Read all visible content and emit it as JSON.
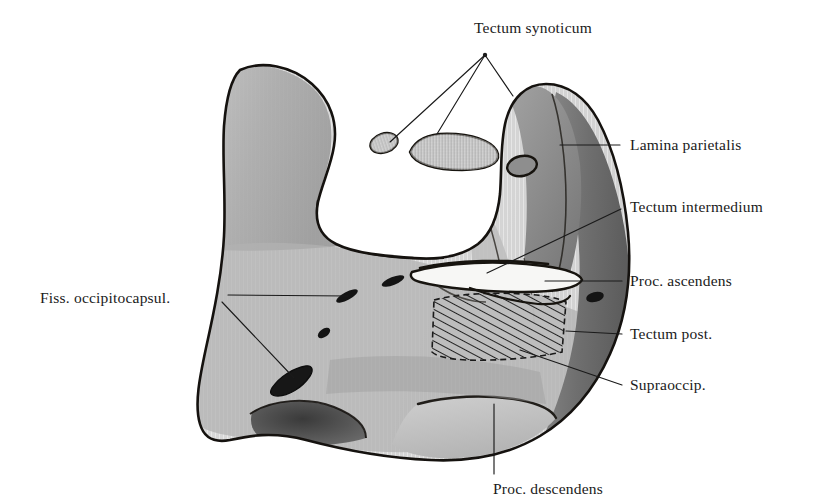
{
  "figure": {
    "kind": "anatomical-illustration",
    "background_color": "#ffffff",
    "ink_color": "#1a1a1a",
    "tones": {
      "light_gray": "#c9c9c9",
      "mid_gray": "#a8a8a8",
      "dark_gray": "#7b7b7b",
      "deep_gray": "#5a5a5a",
      "shadow": "#3b3b3b",
      "outline": "#15120f"
    }
  },
  "labels": [
    {
      "id": "tectum-synoticum",
      "text": "Tectum synoticum",
      "x": 474,
      "y": 20,
      "align": "left",
      "leader_from": [
        485,
        55
      ],
      "leader_to": [
        [
          390,
          142
        ],
        [
          437,
          134
        ],
        [
          512,
          95
        ]
      ]
    },
    {
      "id": "lamina-parietalis",
      "text": "Lamina parietalis",
      "x": 630,
      "y": 137,
      "align": "left",
      "leader_from": [
        620,
        145
      ],
      "leader_to": [
        [
          560,
          145
        ]
      ]
    },
    {
      "id": "tectum-intermedium",
      "text": "Tectum intermedium",
      "x": 630,
      "y": 199,
      "align": "left",
      "leader_from": [
        621,
        209
      ],
      "leader_to": [
        [
          487,
          273
        ]
      ]
    },
    {
      "id": "proc-ascendens",
      "text": "Proc. ascendens",
      "x": 630,
      "y": 273,
      "align": "left",
      "leader_from": [
        622,
        281
      ],
      "leader_to": [
        [
          545,
          281
        ]
      ]
    },
    {
      "id": "tectum-post",
      "text": "Tectum post.",
      "x": 630,
      "y": 326,
      "align": "left",
      "leader_from": [
        622,
        334
      ],
      "leader_to": [
        [
          568,
          331
        ]
      ]
    },
    {
      "id": "supraoccip",
      "text": "Supraoccip.",
      "x": 630,
      "y": 377,
      "align": "left",
      "leader_from": [
        622,
        385
      ],
      "leader_to": [
        [
          520,
          350
        ]
      ]
    },
    {
      "id": "fiss-occipitocapsul",
      "text": "Fiss. occipitocapsul.",
      "x": 40,
      "y": 290,
      "align": "left",
      "leader_from": [
        228,
        297
      ],
      "leader_to": [
        [
          348,
          296
        ],
        [
          292,
          379
        ]
      ]
    },
    {
      "id": "proc-descendens",
      "text": "Proc. descendens",
      "x": 493,
      "y": 481,
      "align": "left",
      "leader_from": [
        494,
        474
      ],
      "leader_to": [
        [
          494,
          405
        ]
      ]
    }
  ],
  "structures": {
    "main_mass": "large bilobed cartilage plate occupying the centre of the plate",
    "detached_fragments": [
      {
        "id": "fragment-small-oval",
        "center": [
          384,
          143
        ],
        "rx": 13,
        "ry": 9
      },
      {
        "id": "fragment-elongate",
        "center": [
          452,
          150
        ],
        "rx": 44,
        "ry": 15
      },
      {
        "id": "fragment-dark-oval",
        "center": [
          522,
          165
        ],
        "rx": 14,
        "ry": 10
      }
    ],
    "foramina": [
      {
        "id": "foramen-a",
        "center": [
          346,
          296
        ]
      },
      {
        "id": "foramen-b",
        "center": [
          392,
          281
        ]
      },
      {
        "id": "foramen-c",
        "center": [
          324,
          333
        ]
      },
      {
        "id": "foramen-d",
        "center": [
          292,
          379
        ]
      },
      {
        "id": "foramen-e",
        "center": [
          594,
          297
        ]
      }
    ],
    "hatched_region": {
      "id": "supraoccipital-hatching",
      "bounds": [
        432,
        294,
        566,
        362
      ],
      "hatch_angle_deg": 62,
      "hatch_spacing_px": 7
    },
    "fissure_slot": {
      "id": "proc-ascendens-slot",
      "bounds": [
        408,
        262,
        584,
        292
      ]
    }
  }
}
